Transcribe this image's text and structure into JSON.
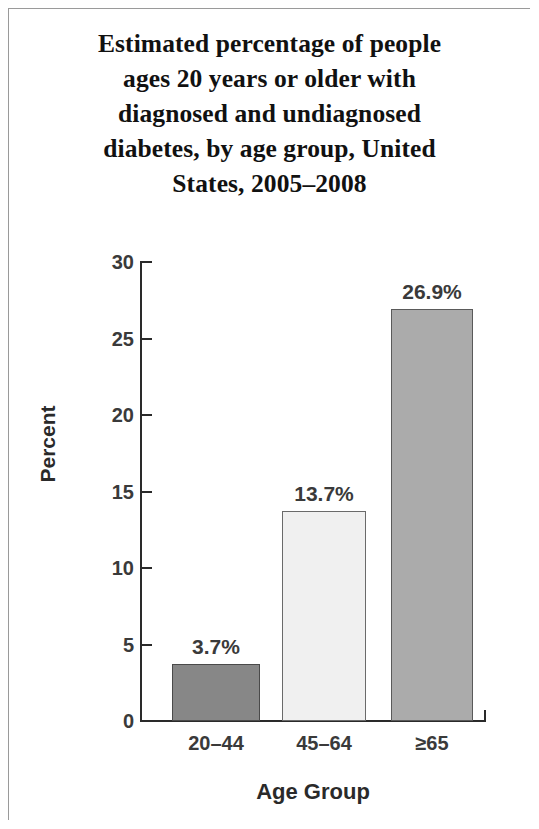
{
  "figure": {
    "title_lines": [
      "Estimated percentage of people",
      "ages 20 years or older with",
      "diagnosed and undiagnosed",
      "diabetes, by age group, United",
      "States, 2005–2008"
    ],
    "border_color": "#9a9a9a",
    "background": "#ffffff"
  },
  "chart_data": {
    "type": "bar",
    "title": "Estimated percentage of people ages 20 years or older with diagnosed and undiagnosed diabetes, by age group, United States, 2005–2008",
    "xlabel": "Age Group",
    "ylabel": "Percent",
    "categories": [
      "20–44",
      "45–64",
      "≥65"
    ],
    "values": [
      3.7,
      13.7,
      26.9
    ],
    "data_labels": [
      "3.7%",
      "13.7%",
      "26.9%"
    ],
    "bar_colors": [
      "#878787",
      "#f0f0f0",
      "#ababab"
    ],
    "bar_border_colors": [
      "#4a4a4a",
      "#6a6a6a",
      "#5a5a5a"
    ],
    "ylim": [
      0,
      30
    ],
    "ytick_step": 5,
    "ytick_labels": [
      "0",
      "5",
      "10",
      "15",
      "20",
      "25",
      "30"
    ],
    "ytick_values": [
      0,
      5,
      10,
      15,
      20,
      25,
      30
    ],
    "grid": false,
    "legend": false,
    "axis_color": "#2a2a2a"
  }
}
